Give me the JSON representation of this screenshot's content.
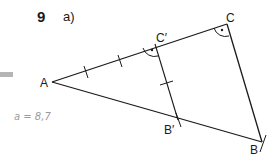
{
  "exercise": {
    "number": "9",
    "part": "a)"
  },
  "points": {
    "A": {
      "label": "A",
      "x": 52,
      "y": 82
    },
    "B": {
      "label": "B",
      "x": 262,
      "y": 142
    },
    "C": {
      "label": "C",
      "x": 227,
      "y": 24
    },
    "B_prime": {
      "label": "B′",
      "x": 178,
      "y": 120
    },
    "C_prime": {
      "label": "C′",
      "x": 155,
      "y": 44
    }
  },
  "annotation": {
    "handwritten_note": "a = 8,7"
  },
  "colors": {
    "line": "#1a1a1a",
    "handwriting": "#9a9a9a",
    "gray_bar": "#b5b5b5"
  }
}
